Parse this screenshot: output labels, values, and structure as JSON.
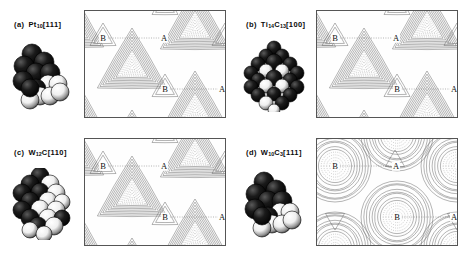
{
  "figure": {
    "background": "#ffffff",
    "frame_color": "#555555",
    "contour_color": "#6a6a6a",
    "contour_dotted_color": "#8a8a8a",
    "atom_dark_color": "#111111",
    "atom_light_color": "#f2f2f2",
    "label_color": "#111111",
    "columns": 2,
    "rows": 2
  },
  "panels": [
    {
      "tag": "(a)",
      "formula_pre": "Pt",
      "formula_sub1": "10",
      "formula_mid": "",
      "formula_sub2": "",
      "orientation": "[111]",
      "caption_plain": "(a) Pt10[111]",
      "cluster_type": "triangular-stack",
      "contour_style": "triangular-maxima",
      "site_labels": [
        {
          "name": "B",
          "x": 18,
          "y": 27
        },
        {
          "name": "A",
          "x": 79,
          "y": 27
        },
        {
          "name": "B",
          "x": 80,
          "y": 78
        },
        {
          "name": "A",
          "x": 137,
          "y": 78
        }
      ]
    },
    {
      "tag": "(b)",
      "formula_pre": "Ti",
      "formula_sub1": "14",
      "formula_mid": "C",
      "formula_sub2": "13",
      "orientation": "[100]",
      "caption_plain": "(b) Ti14C13[100]",
      "cluster_type": "cubic-diamond",
      "contour_style": "triangular-maxima",
      "site_labels": [
        {
          "name": "B",
          "x": 18,
          "y": 27
        },
        {
          "name": "A",
          "x": 79,
          "y": 27
        },
        {
          "name": "B",
          "x": 80,
          "y": 78
        },
        {
          "name": "A",
          "x": 137,
          "y": 78
        }
      ]
    },
    {
      "tag": "(c)",
      "formula_pre": "W",
      "formula_sub1": "12",
      "formula_mid": "C",
      "formula_sub2": "",
      "orientation": "[110]",
      "caption_plain": "(c) W12C[110]",
      "cluster_type": "rhombic-stack",
      "contour_style": "triangular-maxima",
      "site_labels": [
        {
          "name": "B",
          "x": 18,
          "y": 27
        },
        {
          "name": "A",
          "x": 79,
          "y": 27
        },
        {
          "name": "B",
          "x": 80,
          "y": 78
        },
        {
          "name": "A",
          "x": 137,
          "y": 78
        }
      ]
    },
    {
      "tag": "(d)",
      "formula_pre": "W",
      "formula_sub1": "10",
      "formula_mid": "C",
      "formula_sub2": "3",
      "orientation": "[111]",
      "caption_plain": "(d) W10C3[111]",
      "cluster_type": "triangular-stack",
      "contour_style": "circular-maxima",
      "site_labels": [
        {
          "name": "B",
          "x": 18,
          "y": 27
        },
        {
          "name": "A",
          "x": 79,
          "y": 27
        },
        {
          "name": "B",
          "x": 80,
          "y": 78
        },
        {
          "name": "A",
          "x": 137,
          "y": 78
        }
      ]
    }
  ],
  "chart_data": {
    "type": "heatmap",
    "title": "",
    "xlabel": "",
    "ylabel": "",
    "contour_levels": 14,
    "grid": false,
    "legend": "none",
    "maps": [
      {
        "panel": "(a)",
        "system": "Pt10[111]",
        "maxima_shape": "triangular",
        "maxima_centers": [
          [
            47,
            57
          ],
          [
            110,
            18
          ],
          [
            110,
            100
          ]
        ],
        "site_A": "saddle",
        "site_B": "hollow"
      },
      {
        "panel": "(b)",
        "system": "Ti14C13[100]",
        "maxima_shape": "triangular",
        "maxima_centers": [
          [
            47,
            57
          ],
          [
            110,
            18
          ],
          [
            110,
            100
          ]
        ],
        "site_A": "saddle",
        "site_B": "hollow"
      },
      {
        "panel": "(c)",
        "system": "W12C[110]",
        "maxima_shape": "triangular",
        "maxima_centers": [
          [
            47,
            57
          ],
          [
            110,
            18
          ],
          [
            110,
            100
          ]
        ],
        "site_A": "saddle",
        "site_B": "hollow"
      },
      {
        "panel": "(d)",
        "system": "W10C3[111]",
        "maxima_shape": "circular",
        "maxima_centers": [
          [
            18,
            27
          ],
          [
            80,
            78
          ],
          [
            80,
            6
          ],
          [
            140,
            27
          ]
        ],
        "site_A": "saddle",
        "site_B": "maximum"
      }
    ]
  }
}
